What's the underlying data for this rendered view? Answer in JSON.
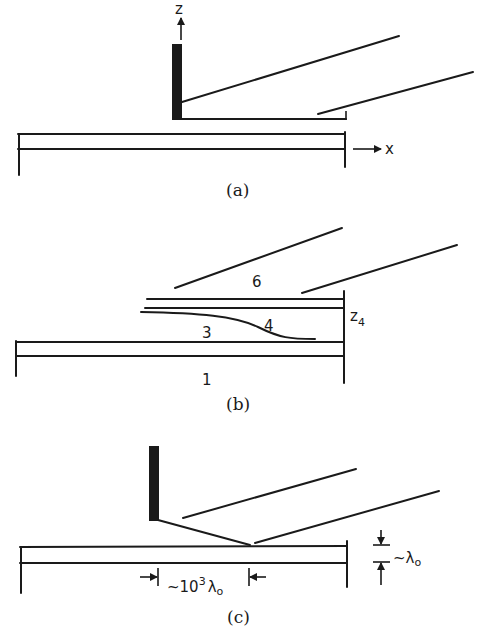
{
  "figure": {
    "panels": [
      {
        "id": "a",
        "caption": "(a)",
        "axis_labels": {
          "z": "z",
          "x": "x"
        }
      },
      {
        "id": "b",
        "caption": "(b)",
        "region_labels": {
          "r6": "6",
          "r3": "3",
          "r4": "4",
          "r1": "1"
        },
        "height_label": {
          "main": "z",
          "subscript": "4"
        }
      },
      {
        "id": "c",
        "caption": "(c)",
        "horizontal_dimension": {
          "prefix": "~10",
          "exponent": "3",
          "symbol": "λ",
          "subscript": "o"
        },
        "vertical_dimension": {
          "prefix": "~",
          "symbol": "λ",
          "subscript": "o"
        }
      }
    ],
    "colors": {
      "ink": "#1a1a1a",
      "background": "#ffffff"
    }
  }
}
